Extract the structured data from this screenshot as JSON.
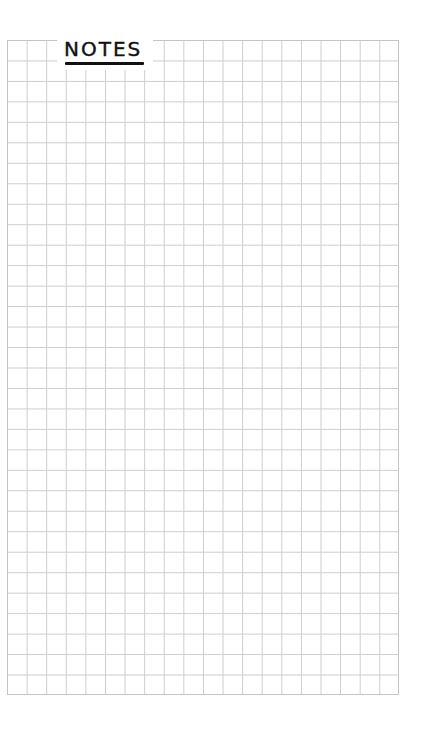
{
  "page": {
    "title": "NOTES",
    "grid": {
      "columns": 20,
      "rows": 32,
      "line_color": "#cdcdcd"
    },
    "background_color": "#ffffff",
    "title_color": "#111111"
  }
}
